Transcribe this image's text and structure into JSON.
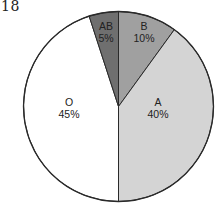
{
  "page": {
    "number": "18"
  },
  "chart_data": {
    "type": "pie",
    "title": "",
    "categories": [
      "AB",
      "B",
      "A",
      "O"
    ],
    "values": [
      5,
      10,
      40,
      45
    ],
    "labels": [
      "5%",
      "10%",
      "40%",
      "45%"
    ],
    "colors": [
      "#6f6f6f",
      "#a0a0a0",
      "#d4d4d4",
      "#ffffff"
    ],
    "start_angle_deg": 0,
    "direction": "clockwise-from-top",
    "order_clockwise_from_top": [
      "B",
      "A",
      "O",
      "AB"
    ],
    "legend": "none (labels inside slices)"
  },
  "slices": [
    {
      "name": "B",
      "value": 10,
      "pct_label": "10%",
      "color": "#a0a0a0"
    },
    {
      "name": "A",
      "value": 40,
      "pct_label": "40%",
      "color": "#d4d4d4"
    },
    {
      "name": "O",
      "value": 45,
      "pct_label": "45%",
      "color": "#ffffff"
    },
    {
      "name": "AB",
      "value": 5,
      "pct_label": "5%",
      "color": "#6f6f6f"
    }
  ]
}
